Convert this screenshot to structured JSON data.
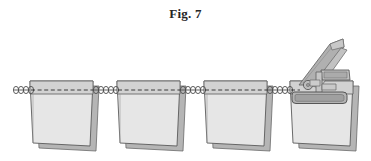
{
  "figure": {
    "caption": "Fig. 7",
    "label_number": "7",
    "background_color": "#ffffff"
  },
  "palette": {
    "outline": "#5a5a5a",
    "outline_dark": "#404040",
    "sheet_front_fill": "#e3e3e3",
    "sheet_front_fill_light": "#ebebeb",
    "sheet_back_fill": "#b5b5b5",
    "sheet_top_band_fill": "#d2d2d2",
    "wire_stroke": "#4d4d4d",
    "dashed_line": "#2b2b2b",
    "clamp_fill": "#b9b9b9",
    "clamp_fill_dark": "#a2a2a2",
    "clamp_fill_light": "#cfcfcf",
    "lever_fill": "#b0b0b0",
    "lever_fill_light": "#c6c6c6",
    "caption_color": "#262626"
  },
  "geometry": {
    "canvas_width": 371,
    "canvas_height": 161,
    "wire_y": 90,
    "wire_x_start": 14,
    "wire_x_end": 300,
    "sheet_top_y": 81,
    "sheet_bottom_y": 146
  },
  "sheets": [
    {
      "id": "sheet-1",
      "index": 1,
      "x": 30,
      "width": 63,
      "hanging": true,
      "has_clamp": false
    },
    {
      "id": "sheet-2",
      "index": 2,
      "x": 117,
      "width": 63,
      "hanging": true,
      "has_clamp": false
    },
    {
      "id": "sheet-3",
      "index": 3,
      "x": 204,
      "width": 63,
      "hanging": true,
      "has_clamp": false
    },
    {
      "id": "sheet-4",
      "index": 4,
      "x": 290,
      "width": 63,
      "hanging": true,
      "has_clamp": true
    }
  ],
  "wire": {
    "name": "coiled hanging wire",
    "coil_groups": [
      {
        "id": "coil-group-1",
        "x_start": 14,
        "loops": 4
      },
      {
        "id": "coil-group-2",
        "x_start": 93,
        "loops": 5
      },
      {
        "id": "coil-group-3",
        "x_start": 180,
        "loops": 5
      },
      {
        "id": "coil-group-4",
        "x_start": 267,
        "loops": 5
      }
    ],
    "loop_width": 5,
    "loop_height": 7
  },
  "clamp": {
    "name": "spring clamp assembly",
    "lever_angle_deg": -48,
    "parts": [
      {
        "id": "clamp-lever-arm",
        "label": "lever arm"
      },
      {
        "id": "clamp-upper-jaw",
        "label": "upper jaw bar"
      },
      {
        "id": "clamp-pivot",
        "label": "pivot hinge"
      },
      {
        "id": "clamp-lower-jaw",
        "label": "lower jaw bar"
      },
      {
        "id": "clamp-post",
        "label": "vertical post"
      }
    ]
  }
}
